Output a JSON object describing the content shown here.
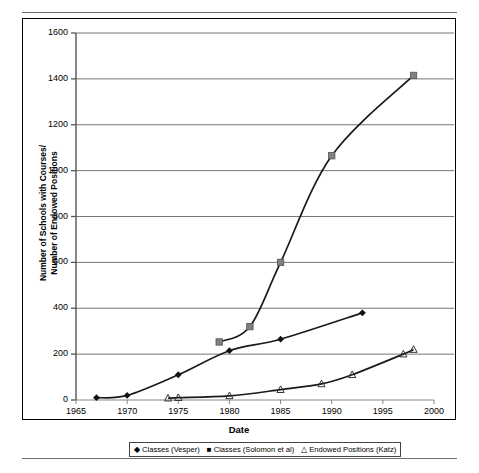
{
  "chart_data": {
    "type": "line",
    "title": "",
    "xlabel": "Date",
    "ylabel_line1": "Number of Schools with Courses/",
    "ylabel_line2": "Number of Endowed Positions",
    "xlim": [
      1965,
      2000
    ],
    "ylim": [
      0,
      1600
    ],
    "xticks": [
      1965,
      1970,
      1975,
      1980,
      1985,
      1990,
      1995,
      2000
    ],
    "yticks": [
      0,
      200,
      400,
      600,
      800,
      1000,
      1200,
      1400,
      1600
    ],
    "grid": "horizontal",
    "legend_position": "below-axis",
    "series": [
      {
        "name": "Classes (Vesper)",
        "marker": "diamond",
        "marker_glyph": "◆",
        "color": "#1a1a1a",
        "x": [
          1967,
          1970,
          1975,
          1980,
          1985,
          1993
        ],
        "y": [
          10,
          20,
          110,
          215,
          265,
          380
        ]
      },
      {
        "name": "Classes (Solomon et al)",
        "marker": "square",
        "marker_glyph": "■",
        "color": "#1a1a1a",
        "x": [
          1979,
          1982,
          1985,
          1990,
          1998
        ],
        "y": [
          253,
          320,
          600,
          1065,
          1415
        ]
      },
      {
        "name": "Endowed Positions (Katz)",
        "marker": "triangle",
        "marker_glyph": "△",
        "color": "#1a1a1a",
        "x": [
          1974,
          1975,
          1980,
          1985,
          1989,
          1992,
          1997,
          1998
        ],
        "y": [
          8,
          10,
          18,
          45,
          70,
          110,
          200,
          220
        ]
      }
    ]
  },
  "axis": {
    "y_tick_labels": [
      "1600",
      "1400",
      "1200",
      "1000",
      "800",
      "600",
      "400",
      "200",
      "0"
    ],
    "x_tick_labels": [
      "1965",
      "1970",
      "1975",
      "1980",
      "1985",
      "1990",
      "1995",
      "2000"
    ],
    "x_title": "Date",
    "y_title_line1": "Number of Schools with Courses/",
    "y_title_line2": "Number of Endowed Positions"
  },
  "legend": {
    "entries": [
      {
        "marker": "◆",
        "label": "Classes (Vesper)"
      },
      {
        "marker": "■",
        "label": "Classes (Solomon et al)"
      },
      {
        "marker": "△",
        "label": "Endowed Positions (Katz)"
      }
    ]
  }
}
